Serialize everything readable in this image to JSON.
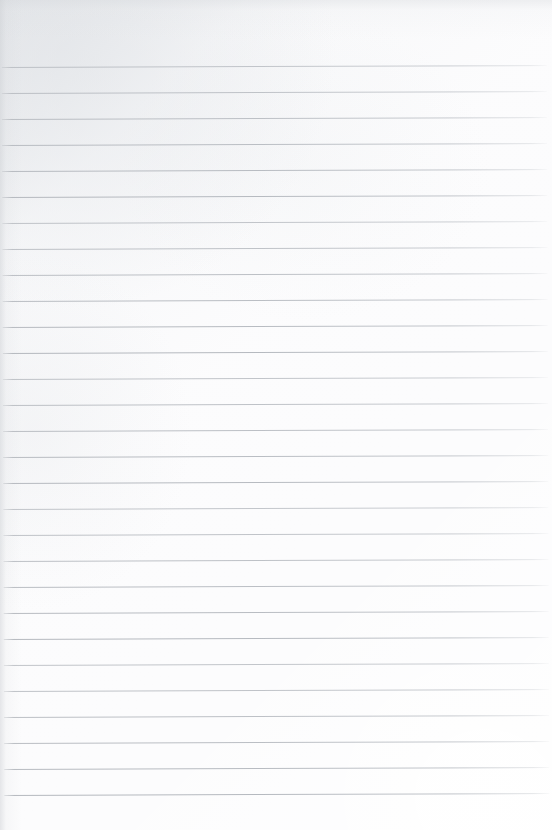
{
  "page": {
    "kind": "ruled-notebook-paper",
    "width_px": 552,
    "height_px": 830,
    "content_text": "",
    "handwriting": "none",
    "header_text": "",
    "footer_text": "",
    "page_number": ""
  },
  "colors": {
    "paper_background": "#fbfbfc",
    "paper_highlight": "#ffffff",
    "paper_shadow": "#e4e6e9",
    "rule_line": "#b4b8be",
    "margin_line": "none"
  },
  "ruling": {
    "style": "wide-ruled horizontal",
    "line_count": 29,
    "first_line_y": 67,
    "line_spacing_px": 26,
    "last_line_y": 808,
    "line_thickness_px": 1,
    "line_start_x": 3,
    "line_end_x": 548,
    "top_margin_px": 67,
    "bottom_margin_px": 22,
    "vertical_margin_rule": false,
    "skew_degrees": -0.2,
    "lines_y": [
      67,
      93,
      119,
      145,
      171,
      197,
      223,
      249,
      275,
      301,
      327,
      353,
      379,
      405,
      431,
      457,
      483,
      509,
      535,
      561,
      587,
      613,
      639,
      665,
      691,
      717,
      743,
      769,
      795
    ]
  }
}
